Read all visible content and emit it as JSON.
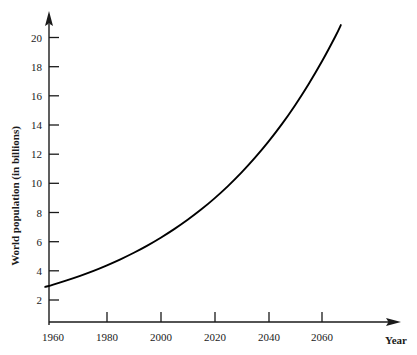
{
  "chart_data": {
    "type": "line",
    "title": "",
    "subtitle": "",
    "xlabel": "Year",
    "ylabel": "World population (in billions)",
    "xlim": [
      1955,
      2072
    ],
    "ylim": [
      0,
      21.6
    ],
    "grid": false,
    "legend": null,
    "legend_position": "none",
    "x_ticks": [
      1960,
      1980,
      2000,
      2020,
      2040,
      2060
    ],
    "x_tick_labels": [
      "1960",
      "1980",
      "2000",
      "2020",
      "2040",
      "2060"
    ],
    "y_ticks": [
      2,
      4,
      6,
      8,
      10,
      12,
      14,
      16,
      18,
      20
    ],
    "y_tick_labels": [
      "2",
      "4",
      "6",
      "8",
      "10",
      "12",
      "14",
      "16",
      "18",
      "20"
    ],
    "axis_style": "arrow-ended L axes, ticks outward on x (upward) and right on y",
    "series": [
      {
        "name": "World population",
        "color": "#000000",
        "x": [
          1957,
          1960,
          1965,
          1970,
          1975,
          1980,
          1985,
          1990,
          1995,
          2000,
          2005,
          2010,
          2015,
          2020,
          2025,
          2030,
          2035,
          2040,
          2045,
          2050,
          2055,
          2060,
          2065,
          2067
        ],
        "y": [
          2.9,
          3.06,
          3.35,
          3.66,
          4.0,
          4.38,
          4.79,
          5.24,
          5.73,
          6.27,
          6.86,
          7.5,
          8.2,
          8.97,
          9.81,
          10.73,
          11.74,
          12.84,
          14.04,
          15.36,
          16.8,
          18.37,
          20.09,
          20.85
        ]
      }
    ],
    "annotations": []
  },
  "axes": {
    "y_axis_title": "World population (in billions)",
    "x_axis_title": "Year",
    "x_tick_labels": [
      "1960",
      "1980",
      "2000",
      "2020",
      "2040",
      "2060"
    ],
    "y_tick_labels": [
      "2",
      "4",
      "6",
      "8",
      "10",
      "12",
      "14",
      "16",
      "18",
      "20"
    ]
  },
  "caption": {
    "fragment": ""
  }
}
